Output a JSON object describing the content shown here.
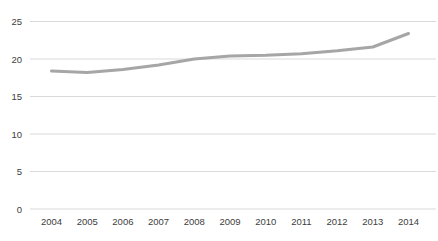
{
  "chart_data": {
    "type": "line",
    "title": "",
    "xlabel": "",
    "ylabel": "",
    "categories": [
      "2004",
      "2005",
      "2006",
      "2007",
      "2008",
      "2009",
      "2010",
      "2011",
      "2012",
      "2013",
      "2014"
    ],
    "values": [
      18.4,
      18.2,
      18.6,
      19.2,
      20.0,
      20.4,
      20.5,
      20.7,
      21.1,
      21.6,
      23.4
    ],
    "ylim": [
      0,
      25
    ],
    "yticks": [
      0,
      5,
      10,
      15,
      20,
      25
    ],
    "grid": true,
    "legend": false,
    "line_color": "#a6a6a6",
    "gridline_color": "#d9d9d9",
    "tick_label_color": "#404040",
    "background_color": "#ffffff"
  }
}
